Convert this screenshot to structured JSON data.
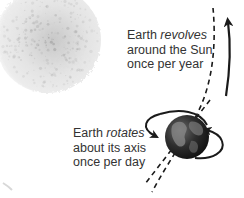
{
  "diagram": {
    "revolution_label": {
      "line1_prefix": "Earth ",
      "line1_emphasis": "revolves",
      "line2": "around the Sun",
      "line3": "once per year"
    },
    "rotation_label": {
      "line1_prefix": "Earth ",
      "line1_emphasis": "rotates",
      "line2": "about its axis",
      "line3": "once per day"
    },
    "objects": {
      "sun": "Sun",
      "earth": "Earth"
    },
    "colors": {
      "text": "#333333",
      "arrow": "#1a1a1a",
      "sun_fill": "#e6e6e6",
      "sun_speckle": "#9a9a9a",
      "earth_dark": "#1e1e1e",
      "earth_land": "#8c8c8c"
    }
  }
}
